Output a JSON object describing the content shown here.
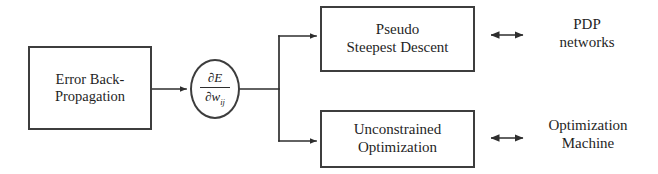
{
  "diagram": {
    "stroke_color": "#3d3d3d",
    "text_color": "#1f1f1f",
    "background_color": "#ffffff"
  },
  "nodes": {
    "source_box": {
      "name": "Error Back-Propagation",
      "line1": "Error Back-",
      "line2": "Propagation"
    },
    "gradient_ellipse": {
      "name": "partial derivative of E with respect to w sub ij",
      "numerator": "∂E",
      "denominator_symbol": "∂w",
      "denominator_subscript": "ij"
    },
    "top_box": {
      "name": "Pseudo Steepest Descent",
      "line1": "Pseudo",
      "line2": "Steepest Descent"
    },
    "bottom_box": {
      "name": "Unconstrained Optimization",
      "line1": "Unconstrained",
      "line2": "Optimization"
    }
  },
  "labels": {
    "top_right": {
      "name": "PDP networks",
      "line1": "PDP",
      "line2": "networks"
    },
    "bottom_right": {
      "name": "Optimization Machine",
      "line1": "Optimization",
      "line2": "Machine"
    }
  },
  "connectors": {
    "source_to_gradient": "arrow-right",
    "gradient_to_branch": "line-then-split",
    "branch_to_top_box": "arrow-right",
    "branch_to_bottom_box": "arrow-right",
    "top_box_to_label": "double-headed-arrow",
    "bottom_box_to_label": "double-headed-arrow",
    "equivalence_symbol": "⟷"
  }
}
